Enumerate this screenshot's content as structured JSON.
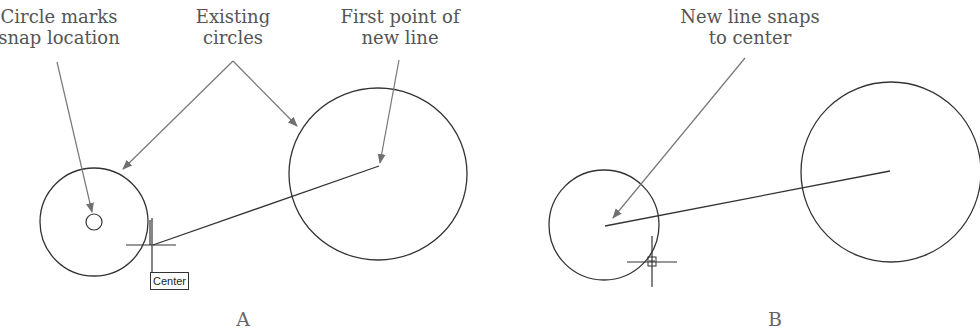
{
  "colors": {
    "geometry": "#333333",
    "leader": "#777777",
    "text": "#555555"
  },
  "panels": [
    {
      "letter": "A",
      "callouts": [
        {
          "id": "snap-location",
          "lines": [
            "Circle marks",
            "snap location"
          ]
        },
        {
          "id": "existing-circles",
          "lines": [
            "Existing",
            "circles"
          ]
        },
        {
          "id": "first-point",
          "lines": [
            "First point of",
            "new line"
          ]
        }
      ],
      "tooltip": "Center"
    },
    {
      "letter": "B",
      "callouts": [
        {
          "id": "snaps-to-center",
          "lines": [
            "New line snaps",
            "to center"
          ]
        }
      ]
    }
  ]
}
